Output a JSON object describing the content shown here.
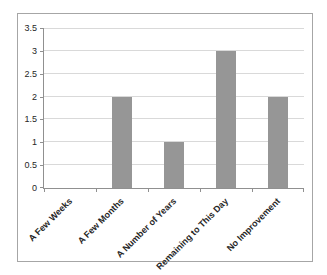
{
  "chart_data": {
    "type": "bar",
    "categories": [
      "A Few Weeks",
      "A Few Months",
      "A Number of Years",
      "Remaining to This Day",
      "No Improvement"
    ],
    "values": [
      0,
      2,
      1,
      3,
      2
    ],
    "title": "",
    "xlabel": "",
    "ylabel": "",
    "ylim": [
      0,
      3.5
    ],
    "ytick_step": 0.5,
    "yticks": [
      "3.5",
      "3",
      "2.5",
      "2",
      "1.5",
      "1",
      "0.5",
      "0"
    ],
    "grid": "horizontal",
    "legend": "none",
    "bar_color": "#969696"
  },
  "colors": {
    "bar": "#969696",
    "gridline": "#D9D9D9",
    "axis": "#909090",
    "frame_border": "#A6A6A6",
    "background": "#FFFFFF",
    "text": "#262626"
  }
}
